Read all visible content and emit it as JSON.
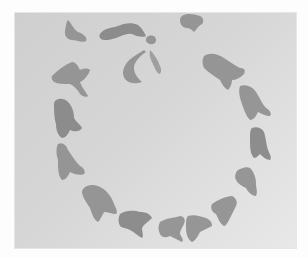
{
  "image": {
    "description": "Photograph of a paper artwork: gray cut-out organic shapes (bird/bell-like silhouettes) arranged in a ring on light gray paper",
    "colors": {
      "border": "#fdfdfd",
      "paper": "#d4d4d4",
      "paper_light": "#e8e8e8",
      "shape": "#8f8f8f"
    },
    "paper_bounds": {
      "x": 15,
      "y": 13,
      "width": 281,
      "height": 235
    },
    "shapes": [
      {
        "name": "shape-top-left-small",
        "tone": "",
        "d": "M68 20 C72 24 74 30 78 32 C84 34 88 38 86 41 C82 43 76 40 72 40 C68 40 64 36 65 31 C66 27 66 22 68 20 Z"
      },
      {
        "name": "shape-top-comma",
        "tone": "dark",
        "d": "M100 34 C104 28 112 28 118 26 C124 23 132 22 138 25 C142 28 144 32 146 36 C142 38 136 36 132 34 C126 33 122 36 116 38 C110 40 104 41 101 39 C99 37 99 35 100 34 Z"
      },
      {
        "name": "shape-top-dot",
        "tone": "",
        "d": "M147 37 C149 35 153 35 155 37 C157 40 156 43 153 44 C150 45 147 43 146 41 C146 39 146 38 147 37 Z"
      },
      {
        "name": "shape-crescent",
        "tone": "",
        "d": "M144 50 C138 54 130 58 126 64 C122 70 122 76 126 80 C130 84 136 84 142 82 C138 78 134 74 134 68 C134 62 140 56 146 52 Z"
      },
      {
        "name": "shape-teardrop",
        "tone": "light",
        "d": "M150 50 C154 54 158 60 160 66 C162 70 161 74 159 74 C156 72 154 66 152 62 C150 58 149 54 150 50 Z"
      },
      {
        "name": "shape-top-right-blob",
        "tone": "",
        "d": "M182 16 C186 13 194 14 200 16 C204 18 204 22 202 24 C198 26 196 30 194 32 C192 30 190 28 186 28 C182 27 180 24 180 20 C180 18 181 17 182 16 Z"
      },
      {
        "name": "shape-left-upper-bird",
        "tone": "",
        "d": "M52 76 C58 70 66 64 72 62 C76 62 78 66 80 70 C84 68 88 68 90 70 C88 76 84 80 80 82 C82 88 86 92 88 96 C86 98 82 96 80 94 C78 90 74 86 70 84 C64 84 58 84 54 82 C52 80 51 78 52 76 Z"
      },
      {
        "name": "shape-left-mid-bell",
        "tone": "dark",
        "d": "M56 100 C60 98 64 98 68 102 C72 106 74 112 74 118 C76 122 80 124 82 128 C80 132 74 132 70 130 C68 134 66 138 62 138 C58 136 56 130 56 124 C54 118 54 110 54 104 C54 102 55 101 56 100 Z"
      },
      {
        "name": "shape-left-lower-bell",
        "tone": "",
        "d": "M58 144 C62 142 66 144 68 150 C72 156 76 162 80 166 C84 168 86 172 84 174 C80 176 74 174 70 172 C68 176 66 180 62 180 C58 176 58 168 58 160 C56 154 56 148 58 144 Z"
      },
      {
        "name": "shape-bottom-left-bird",
        "tone": "",
        "d": "M84 188 C88 184 96 184 102 188 C108 192 112 198 114 204 C116 208 118 212 116 214 C112 214 108 212 104 212 C102 216 100 220 98 222 C94 220 92 214 90 208 C86 202 82 196 82 192 C82 190 83 189 84 188 Z"
      },
      {
        "name": "shape-bottom-bird-a",
        "tone": "dark",
        "d": "M120 214 C126 210 134 210 140 212 C146 212 150 214 152 218 C148 222 144 224 142 228 C142 232 144 236 142 238 C138 236 134 232 130 230 C126 228 122 228 120 226 C118 222 118 218 120 214 Z"
      },
      {
        "name": "shape-bottom-bird-b",
        "tone": "",
        "d": "M160 222 C166 218 174 218 180 216 C184 216 186 220 184 224 C182 228 180 230 180 234 C182 238 184 240 182 242 C178 240 174 238 170 236 C166 238 162 238 160 234 C158 230 158 226 160 222 Z"
      },
      {
        "name": "shape-bottom-bird-c",
        "tone": "",
        "d": "M188 216 C194 214 200 216 206 218 C210 220 212 222 212 226 C208 228 204 230 200 232 C198 236 196 240 192 242 C188 240 186 234 186 228 C186 222 186 218 188 216 Z"
      },
      {
        "name": "shape-bottom-right-bird",
        "tone": "",
        "d": "M212 204 C218 200 226 196 232 196 C236 198 238 202 236 206 C234 210 232 214 230 218 C228 222 226 226 224 226 C220 224 218 218 216 214 C212 212 210 208 212 204 Z"
      },
      {
        "name": "shape-right-lower-bell",
        "tone": "",
        "d": "M238 170 C242 168 246 166 250 168 C254 172 256 178 256 184 C256 188 258 192 256 196 C252 196 248 192 246 188 C242 186 238 184 236 180 C234 176 236 172 238 170 Z"
      },
      {
        "name": "shape-right-mid-bell",
        "tone": "dark",
        "d": "M252 128 C256 126 262 128 264 132 C266 138 266 144 268 150 C270 154 272 158 270 160 C266 160 262 156 260 154 C258 156 256 158 254 158 C250 154 250 146 250 140 C250 134 250 130 252 128 Z"
      },
      {
        "name": "shape-right-upper-bird",
        "tone": "",
        "d": "M240 86 C246 84 252 86 256 92 C260 98 262 104 266 108 C270 110 272 114 270 116 C266 116 262 114 258 112 C256 116 254 120 250 120 C246 116 244 110 242 104 C240 98 238 92 240 86 Z"
      },
      {
        "name": "shape-top-right-bird",
        "tone": "",
        "d": "M204 56 C210 52 218 54 224 58 C230 62 236 66 240 68 C244 68 246 70 244 74 C240 78 236 80 232 80 C232 84 230 88 228 90 C224 88 222 84 220 80 C214 76 208 72 204 68 C202 64 202 60 204 56 Z"
      }
    ]
  }
}
